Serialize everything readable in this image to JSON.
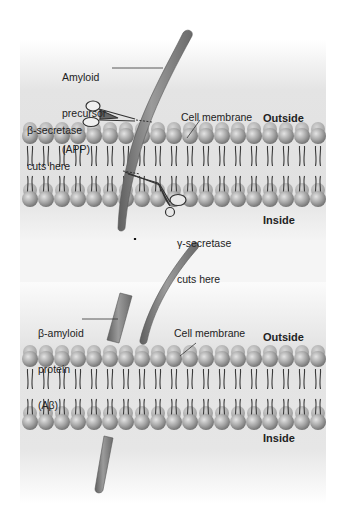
{
  "figure": {
    "panels": [
      {
        "id": "before",
        "labels": {
          "app": [
            "Amyloid",
            "precursor",
            "(APP)"
          ],
          "beta_secretase": [
            "β-secretase",
            "cuts here"
          ],
          "membrane": "Cell membrane",
          "outside": "Outside",
          "gamma_secretase": [
            "γ-secretase",
            "cuts here"
          ],
          "inside": "Inside"
        }
      },
      {
        "id": "after",
        "labels": {
          "abeta": [
            "β-amyloid",
            "protein",
            "(Aβ)"
          ],
          "membrane": "Cell membrane",
          "outside": "Outside",
          "inside": "Inside"
        }
      }
    ],
    "arrow": {
      "direction": "down"
    },
    "colors": {
      "protein": "#7d7d7d",
      "protein_highlight": "#a8a8a8",
      "lipid_head": "#a9a9a9",
      "lipid_tail": "#3a3a3a",
      "background_band": "#e2e2e2",
      "text": "#222222"
    }
  }
}
